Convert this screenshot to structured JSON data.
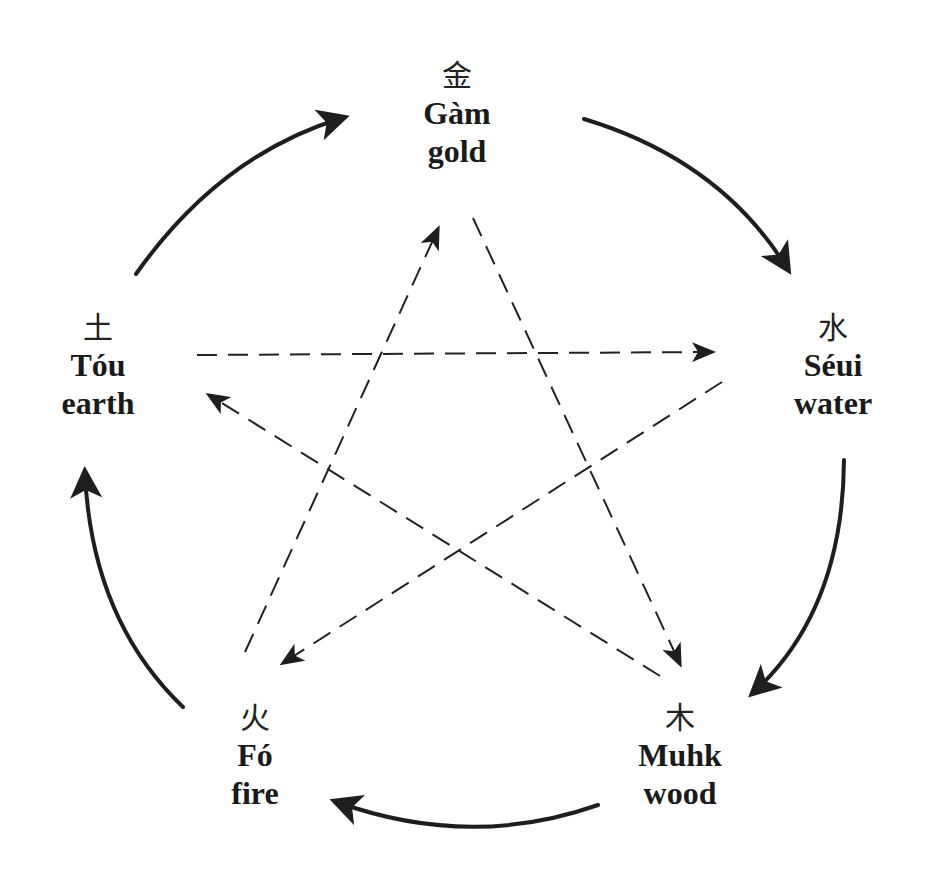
{
  "diagram": {
    "colors": {
      "ink": "#1e1e1e",
      "background": "#ffffff"
    },
    "nodes": {
      "gold": {
        "hanzi": "金",
        "romanization": "Gàm",
        "english": "gold"
      },
      "water": {
        "hanzi": "水",
        "romanization": "Séui",
        "english": "water"
      },
      "wood": {
        "hanzi": "木",
        "romanization": "Muhk",
        "english": "wood"
      },
      "fire": {
        "hanzi": "火",
        "romanization": "Fó",
        "english": "fire"
      },
      "earth": {
        "hanzi": "土",
        "romanization": "Tóu",
        "english": "earth"
      }
    },
    "generating_cycle": [
      {
        "from": "gold",
        "to": "water",
        "style": "solid-curved"
      },
      {
        "from": "water",
        "to": "wood",
        "style": "solid-curved"
      },
      {
        "from": "wood",
        "to": "fire",
        "style": "solid-curved"
      },
      {
        "from": "fire",
        "to": "earth",
        "style": "solid-curved"
      },
      {
        "from": "earth",
        "to": "gold",
        "style": "solid-curved"
      }
    ],
    "overcoming_cycle": [
      {
        "from": "gold",
        "to": "wood",
        "style": "dashed-straight"
      },
      {
        "from": "wood",
        "to": "earth",
        "style": "dashed-straight"
      },
      {
        "from": "earth",
        "to": "water",
        "style": "dashed-straight"
      },
      {
        "from": "water",
        "to": "fire",
        "style": "dashed-straight"
      },
      {
        "from": "fire",
        "to": "gold",
        "style": "dashed-straight"
      }
    ]
  }
}
